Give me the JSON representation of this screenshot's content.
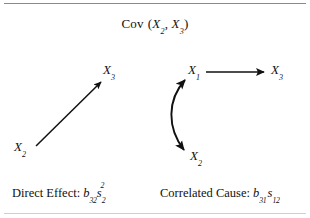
{
  "figure": {
    "title": {
      "function_name": "Cov",
      "open_paren": "(",
      "var1": "X",
      "var1_sub": "2",
      "comma": ", ",
      "var2": "X",
      "var2_sub": "3",
      "close_paren": ")",
      "full_text": "Cov (X2, X3)"
    },
    "rules": {
      "top_color": "#8a8a8a",
      "bottom_color": "#cfcfcf"
    },
    "ink_color": "#111111",
    "background_color": "#ffffff"
  },
  "panels": [
    {
      "id": "direct-effect",
      "nodes": [
        {
          "id": "x2",
          "base": "X",
          "sub": "2"
        },
        {
          "id": "x3",
          "base": "X",
          "sub": "3"
        }
      ],
      "edges": [
        {
          "id": "x2-to-x3",
          "kind": "straight-arrow",
          "heads": "single",
          "from": "x2",
          "to": "x3"
        }
      ],
      "caption": {
        "label": "Direct Effect:",
        "formula_text": "b32 s2^2",
        "terms": [
          {
            "base": "b",
            "sub": "32"
          },
          {
            "base": "s",
            "sub": "2",
            "sup": "2"
          }
        ]
      }
    },
    {
      "id": "correlated-cause",
      "nodes": [
        {
          "id": "x1",
          "base": "X",
          "sub": "1"
        },
        {
          "id": "x2",
          "base": "X",
          "sub": "2"
        },
        {
          "id": "x3",
          "base": "X",
          "sub": "3"
        }
      ],
      "edges": [
        {
          "id": "x1-to-x3",
          "kind": "straight-arrow",
          "heads": "single",
          "from": "x1",
          "to": "x3"
        },
        {
          "id": "x1-x2-covariance",
          "kind": "curved-arrow",
          "heads": "double",
          "from": "x1",
          "to": "x2"
        }
      ],
      "caption": {
        "label": "Correlated Cause:",
        "formula_text": "b31 s12",
        "terms": [
          {
            "base": "b",
            "sub": "31"
          },
          {
            "base": "s",
            "sub": "12"
          }
        ]
      }
    }
  ]
}
